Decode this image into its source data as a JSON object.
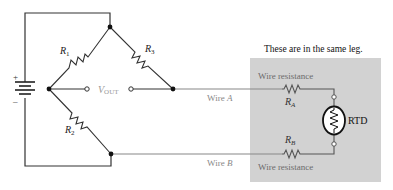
{
  "diagram": {
    "type": "wheatstone-bridge-2wire-rtd",
    "battery": {
      "plus": "+",
      "minus": "–"
    },
    "resistors": {
      "r1": {
        "main": "R",
        "sub": "1"
      },
      "r2": {
        "main": "R",
        "sub": "2"
      },
      "r3": {
        "main": "R",
        "sub": "3"
      }
    },
    "vout": {
      "main": "V",
      "sub": "OUT"
    },
    "wire_a": {
      "prefix": "Wire ",
      "letter": "A"
    },
    "wire_b": {
      "prefix": "Wire ",
      "letter": "B"
    },
    "same_leg_note": "These are in the same leg.",
    "wire_resistance_top": "Wire resistance",
    "wire_resistance_bottom": "Wire resistance",
    "ra": {
      "main": "R",
      "sub": "A"
    },
    "rb": {
      "main": "R",
      "sub": "B"
    },
    "rtd_label": "RTD",
    "colors": {
      "wire": "#222222",
      "wire_light": "#888888",
      "box_fill": "#cfcfcf",
      "label_gray": "#888888",
      "label_dark": "#111111",
      "label_box": "#6b6b6b"
    }
  }
}
